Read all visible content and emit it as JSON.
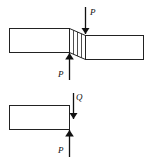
{
  "diagram": {
    "top_figure": {
      "description": "Beam with shear deformation zone under opposing forces",
      "force_top": {
        "label": "P",
        "direction": "down"
      },
      "force_bottom": {
        "label": "P",
        "direction": "up"
      }
    },
    "bottom_figure": {
      "description": "Free body of left segment",
      "force_shear": {
        "label": "Q",
        "direction": "down"
      },
      "force_applied": {
        "label": "P",
        "direction": "up"
      }
    },
    "colors": {
      "stroke": "#222222",
      "background": "#ffffff"
    }
  }
}
